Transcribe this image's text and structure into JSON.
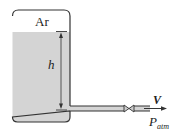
{
  "diagram": {
    "gas_label": "Ar",
    "height_label": "h",
    "velocity_label": "V",
    "pressure_label": "P",
    "pressure_subscript": "atm",
    "colors": {
      "liquid": "#d4d4d4",
      "outline": "#333333",
      "background": "#ffffff"
    }
  }
}
